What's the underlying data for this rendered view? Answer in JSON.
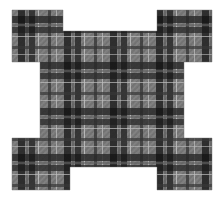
{
  "image": {
    "kind": "fabric-swatch-photograph",
    "subject": "plaid tartan cloth cut into a stepped cross shape",
    "canvas": {
      "width": 221,
      "height": 199
    },
    "background_color": "#ffffff"
  },
  "shape": {
    "name": "stepped-cross-swatch",
    "description": "square swatch with a rectangular notch removed from the middle of each of the four edges, leaving four corner tabs",
    "bounds": {
      "left": 12,
      "top": 10,
      "right": 212,
      "bottom": 190
    },
    "notch_depth_top": 21,
    "notch_depth_bottom": 23,
    "notch_depth_left": 28,
    "notch_depth_right": 28,
    "inner_left": 63,
    "inner_right": 157,
    "inner_top": 31,
    "inner_bottom": 167,
    "polygon_points": "12,10 63,10 63,31 157,31 157,10 212,10 212,62 184,62 184,138 212,138 212,190 157,190 157,167 70,167 70,190 12,190 12,138 40,138 40,62 12,62"
  },
  "palette": {
    "ground_gray": "#8f8f8f",
    "mid_gray": "#7a7a7a",
    "light_gray": "#a3a3a3",
    "dark_stripe": "#343434",
    "black_stripe": "#1a1a1a",
    "pale_line": "#c9c9c9",
    "background": "#ffffff"
  },
  "pattern": {
    "type": "tartan-plaid",
    "weave": "twill diagonal texture",
    "repeat_px": 46,
    "vertical_stripes": [
      {
        "offset": 0,
        "width": 7,
        "color": "#2a2a2a"
      },
      {
        "offset": 8,
        "width": 2,
        "color": "#6e6e6e"
      },
      {
        "offset": 11,
        "width": 6,
        "color": "#303030"
      },
      {
        "offset": 20,
        "width": 1,
        "color": "#cfcfcf"
      },
      {
        "offset": 30,
        "width": 3,
        "color": "#3a3a3a"
      },
      {
        "offset": 38,
        "width": 1,
        "color": "#cfcfcf"
      }
    ],
    "horizontal_stripes": [
      {
        "offset": 0,
        "height": 7,
        "color": "#2a2a2a"
      },
      {
        "offset": 8,
        "height": 2,
        "color": "#6e6e6e"
      },
      {
        "offset": 11,
        "height": 6,
        "color": "#303030"
      },
      {
        "offset": 20,
        "height": 1,
        "color": "#cfcfcf"
      },
      {
        "offset": 30,
        "height": 3,
        "color": "#3a3a3a"
      },
      {
        "offset": 38,
        "height": 1,
        "color": "#cfcfcf"
      }
    ],
    "grid_origin": {
      "x": 18,
      "y": 16
    }
  }
}
